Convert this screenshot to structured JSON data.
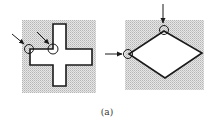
{
  "figure": {
    "caption": "(a)",
    "panels": [
      {
        "name": "cross-shape",
        "shape": "cross",
        "background": "shaded",
        "markers": [
          {
            "type": "circle-with-arrow",
            "location": "concave corner, left arm top-left",
            "arrow_direction": "down-right"
          },
          {
            "type": "circle-with-arrow",
            "location": "concave corner, vertical bar / horizontal bar junction",
            "arrow_direction": "down-right"
          }
        ]
      },
      {
        "name": "diamond-shape",
        "shape": "diamond",
        "background": "shaded",
        "markers": [
          {
            "type": "circle-with-arrow",
            "location": "top vertex",
            "arrow_direction": "down"
          },
          {
            "type": "circle-with-arrow",
            "location": "left vertex",
            "arrow_direction": "right"
          }
        ]
      }
    ]
  },
  "colors": {
    "stroke": "#1a1a1a",
    "shade_light": "#e4e4e4",
    "shade_dark": "#b8b8b8",
    "background": "#ffffff"
  }
}
